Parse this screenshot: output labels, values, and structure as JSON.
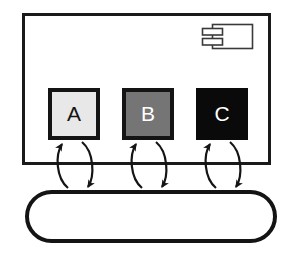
{
  "diagram": {
    "type": "uml-component-diagram",
    "background_color": "#ffffff",
    "stroke_color": "#1a1a1a",
    "container": {
      "name": "component-container",
      "shape": "rectangle",
      "fill": "#ffffff",
      "stroke": "#1a1a1a",
      "stroke_width": 3,
      "x": 22,
      "y": 13,
      "width": 249,
      "height": 152,
      "label": ""
    },
    "component_icon": {
      "name": "uml-component-icon",
      "description": "rectangle with two protruding tabs on left side",
      "x": 212,
      "y": 24,
      "width": 41,
      "height": 25,
      "tab_width": 20,
      "tab_height": 7,
      "stroke": "#3a3a3a",
      "stroke_width": 1.6,
      "fill": "#ffffff"
    },
    "nodes": [
      {
        "id": "A",
        "name": "node-a",
        "label": "A",
        "fill": "#e8e8e8",
        "stroke": "#141414",
        "stroke_width": 4,
        "text_color": "#141414",
        "x": 48,
        "y": 88,
        "width": 52,
        "height": 52
      },
      {
        "id": "B",
        "name": "node-b",
        "label": "B",
        "fill": "#757575",
        "stroke": "#141414",
        "stroke_width": 4,
        "text_color": "#ffffff",
        "x": 122,
        "y": 88,
        "width": 52,
        "height": 52
      },
      {
        "id": "C",
        "name": "node-c",
        "label": "C",
        "fill": "#0a0a0a",
        "stroke": "#0a0a0a",
        "stroke_width": 4,
        "text_color": "#ffffff",
        "x": 196,
        "y": 88,
        "width": 52,
        "height": 52
      }
    ],
    "bus": {
      "name": "bus-stadium",
      "shape": "stadium",
      "fill": "#ffffff",
      "stroke": "#141414",
      "stroke_width": 4,
      "x": 25,
      "y": 190,
      "width": 252,
      "height": 53,
      "label": ""
    },
    "connections": [
      {
        "name": "connection-a",
        "from": "A",
        "to": "bus-stadium",
        "bidirectional": true,
        "up_arrow_x": 62,
        "down_arrow_x": 88,
        "top_y": 141,
        "bottom_y": 189,
        "bow": 13
      },
      {
        "name": "connection-b",
        "from": "B",
        "to": "bus-stadium",
        "bidirectional": true,
        "up_arrow_x": 136,
        "down_arrow_x": 162,
        "top_y": 141,
        "bottom_y": 189,
        "bow": 13
      },
      {
        "name": "connection-c",
        "from": "C",
        "to": "bus-stadium",
        "bidirectional": true,
        "up_arrow_x": 210,
        "down_arrow_x": 236,
        "top_y": 141,
        "bottom_y": 189,
        "bow": 13
      }
    ]
  }
}
